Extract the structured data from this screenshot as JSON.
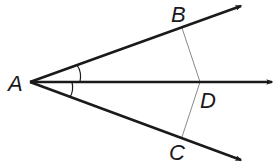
{
  "diagram": {
    "type": "geometry-angle-bisector",
    "points": {
      "A": {
        "label": "A",
        "x": 30,
        "y": 82
      },
      "B": {
        "label": "B",
        "x": 182,
        "y": 27
      },
      "C": {
        "label": "C",
        "x": 182,
        "y": 138
      },
      "D": {
        "label": "D",
        "x": 200,
        "y": 82
      }
    },
    "rays": [
      {
        "name": "ray-AB",
        "from": "A",
        "through": "B"
      },
      {
        "name": "ray-AD",
        "from": "A",
        "through": "D"
      },
      {
        "name": "ray-AC",
        "from": "A",
        "through": "C"
      }
    ],
    "segments": [
      {
        "name": "segment-BD",
        "from": "B",
        "to": "D"
      },
      {
        "name": "segment-DC",
        "from": "D",
        "to": "C"
      }
    ],
    "angle_marks": [
      {
        "name": "angle-BAD",
        "arcs": 1
      },
      {
        "name": "angle-DAC",
        "arcs": 1
      }
    ],
    "colors": {
      "stroke": "#1a1a1a",
      "thin_stroke": "#8a8a8a",
      "background": "#ffffff"
    }
  }
}
